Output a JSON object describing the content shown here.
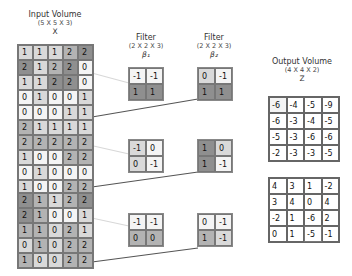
{
  "input": {
    "title": "Input Volume",
    "dims": "(5 X 5 X 3)",
    "symbol": "X",
    "slices": [
      [
        [
          1,
          1,
          1,
          2,
          2
        ],
        [
          2,
          1,
          2,
          2,
          0
        ],
        [
          1,
          1,
          2,
          2,
          0
        ],
        [
          0,
          1,
          0,
          0,
          1
        ],
        [
          0,
          0,
          0,
          1,
          1
        ]
      ],
      [
        [
          2,
          1,
          1,
          1,
          1
        ],
        [
          2,
          2,
          2,
          2,
          2
        ],
        [
          1,
          0,
          0,
          2,
          2
        ],
        [
          0,
          1,
          0,
          0,
          0
        ],
        [
          1,
          0,
          0,
          2,
          2
        ]
      ],
      [
        [
          2,
          1,
          1,
          2,
          2
        ],
        [
          2,
          1,
          0,
          0,
          1
        ],
        [
          1,
          1,
          0,
          2,
          1
        ],
        [
          0,
          1,
          0,
          2,
          2
        ],
        [
          1,
          0,
          0,
          2,
          2
        ]
      ]
    ]
  },
  "filter1": {
    "title": "Filter",
    "dims": "(2 X 2 X 3)",
    "symbol": "β₁",
    "slices": [
      [
        [
          -1,
          -1
        ],
        [
          1,
          1
        ]
      ],
      [
        [
          -1,
          0
        ],
        [
          0,
          -1
        ]
      ],
      [
        [
          -1,
          -1
        ],
        [
          0,
          0
        ]
      ]
    ]
  },
  "filter2": {
    "title": "Filter",
    "dims": "(2 X 2 X 3)",
    "symbol": "β₂",
    "slices": [
      [
        [
          0,
          -1
        ],
        [
          1,
          1
        ]
      ],
      [
        [
          1,
          0
        ],
        [
          1,
          -1
        ]
      ],
      [
        [
          0,
          -1
        ],
        [
          1,
          -1
        ]
      ]
    ]
  },
  "output": {
    "title": "Output Volume",
    "dims": "(4 X 4 X 2)",
    "symbol": "Z",
    "slices": [
      [
        [
          -6,
          -4,
          -5,
          -9
        ],
        [
          -6,
          -3,
          -4,
          -5
        ],
        [
          -5,
          -3,
          -6,
          -6
        ],
        [
          -2,
          -3,
          -3,
          -5
        ]
      ],
      [
        [
          4,
          3,
          1,
          -2
        ],
        [
          3,
          4,
          0,
          4
        ],
        [
          -2,
          1,
          -6,
          2
        ],
        [
          0,
          1,
          -5,
          -1
        ]
      ]
    ]
  }
}
